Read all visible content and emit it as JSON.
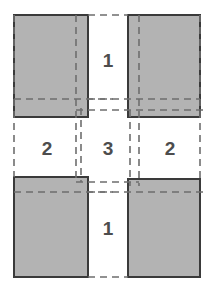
{
  "diagram": {
    "canvas": {
      "width": 212,
      "height": 292,
      "background": "#ffffff"
    },
    "colors": {
      "rect_fill": "#b3b3b3",
      "rect_stroke": "#3a3a3a",
      "dash_stroke": "#6e6e6e",
      "label_text": "#4d4d4d"
    },
    "style": {
      "rect_stroke_width": 2,
      "dash_stroke_width": 1.6,
      "dash_pattern": "7,5"
    },
    "rectangles": [
      {
        "name": "top-left",
        "x": 14,
        "y": 15,
        "width": 74,
        "height": 102
      },
      {
        "name": "top-right",
        "x": 128,
        "y": 15,
        "width": 72,
        "height": 102
      },
      {
        "name": "bottom-left",
        "x": 14,
        "y": 177,
        "width": 74,
        "height": 100
      },
      {
        "name": "bottom-right",
        "x": 128,
        "y": 179,
        "width": 72,
        "height": 98
      }
    ],
    "dashed_lines": {
      "vertical": [
        {
          "name": "left-outer-guide",
          "x": 14,
          "y1": 15,
          "y2": 177
        },
        {
          "name": "top-left-inner-guide",
          "x": 76,
          "y1": 15,
          "y2": 182
        },
        {
          "name": "left-gap-guide",
          "x": 81,
          "y1": 108,
          "y2": 182
        },
        {
          "name": "right-gap-guide",
          "x": 130,
          "y1": 110,
          "y2": 186
        },
        {
          "name": "top-right-inner-guide",
          "x": 139,
          "y1": 15,
          "y2": 186
        },
        {
          "name": "right-outer-guide",
          "x": 200,
          "y1": 15,
          "y2": 179
        }
      ],
      "horizontal": [
        {
          "name": "top-left-lower-edge",
          "y": 99,
          "x1": 14,
          "x2": 113
        },
        {
          "name": "top-band-cross",
          "y": 110,
          "x1": 76,
          "x2": 205
        },
        {
          "name": "top-right-lower-edge",
          "y": 99,
          "x1": 88,
          "x2": 200
        },
        {
          "name": "bottom-band-cross",
          "y": 182,
          "x1": 76,
          "x2": 139
        },
        {
          "name": "bottom-left-upper-edge",
          "y": 192,
          "x1": 14,
          "x2": 113
        },
        {
          "name": "bottom-right-upper-edge",
          "y": 192,
          "x1": 88,
          "x2": 205
        },
        {
          "name": "top-edge-extension",
          "y": 15,
          "x1": 88,
          "x2": 128
        },
        {
          "name": "bottom-edge-extension",
          "y": 277,
          "x1": 88,
          "x2": 128
        }
      ]
    },
    "gap_labels": [
      {
        "name": "gap-top",
        "text": "1",
        "x": 108,
        "y": 62
      },
      {
        "name": "gap-left",
        "text": "2",
        "x": 47,
        "y": 150
      },
      {
        "name": "gap-center",
        "text": "3",
        "x": 108,
        "y": 150
      },
      {
        "name": "gap-right",
        "text": "2",
        "x": 170,
        "y": 150
      },
      {
        "name": "gap-bottom",
        "text": "1",
        "x": 108,
        "y": 230
      }
    ]
  }
}
